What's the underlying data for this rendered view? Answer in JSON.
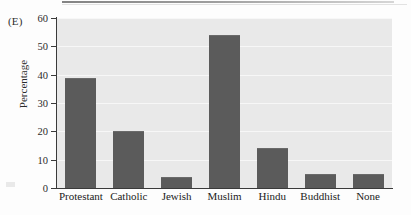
{
  "figure": {
    "panel_label": "(E)",
    "background_color": "#fdfdfd",
    "plot_background_color": "#e9e9e9",
    "bar_color": "#5b5b5b",
    "axis_color": "#3a3a3a",
    "gridline_color": "#f7f7f7"
  },
  "chart_data": {
    "type": "bar",
    "title": "",
    "xlabel": "",
    "ylabel": "Percentage",
    "categories": [
      "Protestant",
      "Catholic",
      "Jewish",
      "Muslim",
      "Hindu",
      "Buddhist",
      "None"
    ],
    "values": [
      39,
      20,
      4,
      54,
      14,
      5,
      5
    ],
    "ylim": [
      0,
      60
    ],
    "yticks": [
      0,
      10,
      20,
      30,
      40,
      50,
      60
    ],
    "ytick_labels": [
      "0",
      "10",
      "20",
      "30",
      "40",
      "50",
      "60"
    ],
    "grid": true,
    "legend": "none",
    "series": [
      {
        "name": "Percentage",
        "values": [
          39,
          20,
          4,
          54,
          14,
          5,
          5
        ]
      }
    ]
  }
}
